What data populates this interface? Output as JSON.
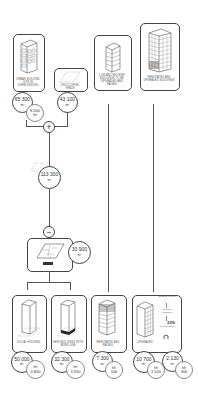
{
  "top_row": [
    {
      "id": "urban-building-land",
      "label": "Urban building site in surrounding",
      "area": "65 300",
      "unit": "m²",
      "sub_value": "8 000",
      "sub_unit": "hh"
    },
    {
      "id": "vacant-space",
      "label": "Unoccupied space",
      "area": "43 100",
      "unit": "m²"
    },
    {
      "id": "low-rise-buildings",
      "label": "Low and mid rise buildings to be upgraded and raised",
      "area": "",
      "unit": ""
    },
    {
      "id": "high-rise-buildings",
      "label": "Renovated and upgraded buildings",
      "area": "",
      "unit": ""
    }
  ],
  "operators": {
    "plus": "+",
    "minus": "−"
  },
  "sum_node": {
    "area": "113 300",
    "unit": "m²"
  },
  "subtract_node": {
    "area": "30 900",
    "unit": "m²"
  },
  "bottom_row": [
    {
      "id": "social-housing",
      "label": "Social housing",
      "area": "50 000",
      "unit": "m²",
      "sub_value": "4 800",
      "sub_unit": "hh"
    },
    {
      "id": "new-buildings-mixed-use",
      "label": "New buildings with mixed use",
      "area": "32 300",
      "unit": "m²",
      "sub_value": "3 900",
      "sub_unit": "hh"
    },
    {
      "id": "renovated-raised",
      "label": "Renovated and raised",
      "area": "7 300",
      "unit": "m²",
      "sub_value": "100",
      "sub_unit": "hh"
    },
    {
      "id": "upgraded",
      "label": "Upgraded",
      "area": "10 700",
      "unit": "m²",
      "sub_value": "1 500",
      "sub_unit": "hh"
    },
    {
      "id": "energy-efficiency",
      "label": "",
      "area": "2 130",
      "unit": "m²",
      "sub_value": "300",
      "sub_unit": "hh",
      "scale": {
        "top": "Building current",
        "middle": "Building upgraded",
        "bottom": "New standard",
        "percent": "33%"
      }
    }
  ],
  "colors": {
    "stroke": "#444444",
    "background": "#ffffff",
    "accent_dark": "#222222"
  }
}
